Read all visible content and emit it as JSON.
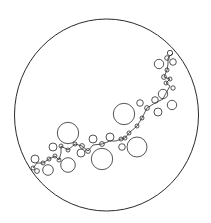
{
  "diagram": {
    "type": "circle-chain",
    "background": "#ffffff",
    "stroke_color": "#2a2a2a",
    "outer": {
      "cx": 106.5,
      "cy": 115,
      "rx": 92,
      "ry": 96,
      "stroke_width": 1
    },
    "path": [
      [
        33,
        168
      ],
      [
        37,
        163
      ],
      [
        43,
        163
      ],
      [
        49,
        159
      ],
      [
        55,
        156
      ],
      [
        59,
        160
      ],
      [
        61,
        153
      ],
      [
        61,
        146
      ],
      [
        68,
        150
      ],
      [
        75,
        144
      ],
      [
        82,
        146
      ],
      [
        88,
        151
      ],
      [
        93,
        145
      ],
      [
        102,
        144
      ],
      [
        110,
        141
      ],
      [
        116,
        141
      ],
      [
        121,
        139
      ],
      [
        125,
        138
      ],
      [
        129,
        133
      ],
      [
        137,
        126
      ],
      [
        142,
        118
      ],
      [
        147,
        108
      ],
      [
        155,
        103
      ],
      [
        163,
        99
      ],
      [
        166,
        93
      ],
      [
        170,
        86
      ],
      [
        166,
        83
      ],
      [
        170,
        79
      ],
      [
        164,
        77
      ],
      [
        167,
        70
      ],
      [
        168,
        64
      ],
      [
        168,
        58
      ],
      [
        173,
        53
      ]
    ],
    "circles": [
      {
        "cx": 170,
        "cy": 53,
        "r": 2.7
      },
      {
        "cx": 167,
        "cy": 58,
        "r": 2.3
      },
      {
        "cx": 173,
        "cy": 62,
        "r": 3.3
      },
      {
        "cx": 159,
        "cy": 64,
        "r": 4.7
      },
      {
        "cx": 167,
        "cy": 70,
        "r": 2
      },
      {
        "cx": 164,
        "cy": 77,
        "r": 2.4
      },
      {
        "cx": 170,
        "cy": 79,
        "r": 2
      },
      {
        "cx": 166,
        "cy": 83,
        "r": 2
      },
      {
        "cx": 173,
        "cy": 88,
        "r": 2.2
      },
      {
        "cx": 163,
        "cy": 94,
        "r": 4.7
      },
      {
        "cx": 155,
        "cy": 100,
        "r": 3.3
      },
      {
        "cx": 172,
        "cy": 105,
        "r": 4.7
      },
      {
        "cx": 140,
        "cy": 103,
        "r": 3.3
      },
      {
        "cx": 147,
        "cy": 108,
        "r": 2.4
      },
      {
        "cx": 158,
        "cy": 112,
        "r": 4
      },
      {
        "cx": 124,
        "cy": 114,
        "r": 10.7
      },
      {
        "cx": 142,
        "cy": 118,
        "r": 2
      },
      {
        "cx": 137,
        "cy": 126,
        "r": 2
      },
      {
        "cx": 129,
        "cy": 133,
        "r": 2
      },
      {
        "cx": 125,
        "cy": 138,
        "r": 2
      },
      {
        "cx": 137,
        "cy": 147,
        "r": 10
      },
      {
        "cx": 121,
        "cy": 139,
        "r": 2
      },
      {
        "cx": 122,
        "cy": 147,
        "r": 3.3
      },
      {
        "cx": 110,
        "cy": 137,
        "r": 4
      },
      {
        "cx": 102,
        "cy": 144,
        "r": 2.4
      },
      {
        "cx": 93,
        "cy": 139,
        "r": 4
      },
      {
        "cx": 102,
        "cy": 159,
        "r": 10.7
      },
      {
        "cx": 88,
        "cy": 151,
        "r": 2.4
      },
      {
        "cx": 81,
        "cy": 153,
        "r": 4
      },
      {
        "cx": 82,
        "cy": 146,
        "r": 2.4
      },
      {
        "cx": 75,
        "cy": 144,
        "r": 2
      },
      {
        "cx": 68,
        "cy": 133,
        "r": 10.7
      },
      {
        "cx": 68,
        "cy": 150,
        "r": 2
      },
      {
        "cx": 61,
        "cy": 146,
        "r": 2
      },
      {
        "cx": 53,
        "cy": 147,
        "r": 4
      },
      {
        "cx": 55,
        "cy": 156,
        "r": 2
      },
      {
        "cx": 68,
        "cy": 165,
        "r": 7.3
      },
      {
        "cx": 59,
        "cy": 160,
        "r": 2
      },
      {
        "cx": 49,
        "cy": 159,
        "r": 2
      },
      {
        "cx": 43,
        "cy": 163,
        "r": 2
      },
      {
        "cx": 48,
        "cy": 170,
        "r": 5.3
      },
      {
        "cx": 35,
        "cy": 159,
        "r": 4
      },
      {
        "cx": 37,
        "cy": 171,
        "r": 2.4
      },
      {
        "cx": 33,
        "cy": 168,
        "r": 2
      }
    ]
  }
}
